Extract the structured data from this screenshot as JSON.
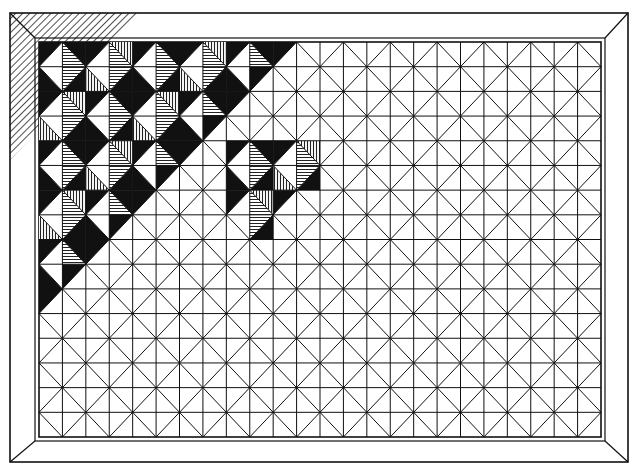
{
  "artwork": {
    "title": "",
    "description": "Black-and-white pen drawing of a framed quilt-like square-in-a-square pattern with a shaded staircase region in the upper-left and a small shaded cluster near the center-left.",
    "ink_color": "#111111",
    "paper_color": "#ffffff",
    "hatch_color": "#222222"
  },
  "frame": {
    "outer": {
      "x1": 10,
      "y1": 13,
      "x2": 628,
      "y2": 462
    },
    "inner": {
      "x1": 39,
      "y1": 42,
      "x2": 601,
      "y2": 437
    },
    "top_left_corner_hatched": true,
    "top_band_hatch_end_x": 140,
    "left_band_hatch_end_y": 160
  },
  "grid": {
    "block_cols": 12,
    "block_rows": 8,
    "note": "Each block is split into 2x2 half-cells, each half-cell split by a diagonal forming an inscribed diamond."
  },
  "shading": {
    "staircase": {
      "description": "Half-cells above the anti-diagonal from the top edge (~x=270) to the left edge (~y=265) are filled.",
      "max_index_sum": 10
    },
    "cluster": {
      "half_col_start": 8,
      "half_col_end": 11,
      "half_row_start": 4,
      "half_row_end": 7
    }
  }
}
